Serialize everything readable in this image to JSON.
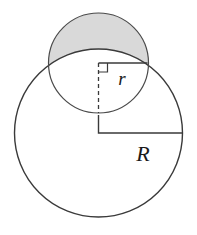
{
  "figure": {
    "background_color": "#ffffff",
    "stroke_color": "#3a3a3a",
    "shaded_fill_color": "#d9d9d9",
    "shaded_region_name": "circular-lens-segment"
  },
  "labels": {
    "small_radius": "r",
    "large_radius": "R"
  },
  "shapes": {
    "large_circle": {
      "name": "large-circle",
      "center_x": 98.5,
      "center_y": 133,
      "radius": 84,
      "stroke_width": 1.4,
      "fill": "none"
    },
    "small_circle": {
      "name": "small-circle",
      "center_x": 98.5,
      "center_y": 63,
      "radius": 50,
      "stroke_width": 1.2,
      "fill": "none"
    },
    "shaded_lens": {
      "name": "shaded-lens",
      "description": "region inside small circle and outside large circle",
      "fill": "#d9d9d9",
      "stroke_width": 1.2
    }
  },
  "annotations": {
    "small_radius_line": {
      "name": "small-radius-segment",
      "x1": 98.5,
      "y1": 63,
      "x2": 147.5,
      "y2": 63,
      "style": "solid"
    },
    "small_vertical_dashed": {
      "name": "small-radius-dashed-segment",
      "x1": 98.5,
      "y1": 63,
      "x2": 98.5,
      "y2": 113,
      "style": "dashed",
      "dash_pattern": "4,3"
    },
    "right_angle_mark": {
      "name": "right-angle-marker",
      "x": 98.5,
      "y": 63,
      "size": 9,
      "direction": "down-right"
    },
    "large_radius_line": {
      "name": "large-radius-segment",
      "x1": 98.5,
      "y1": 133,
      "x2": 182.5,
      "y2": 133,
      "style": "solid"
    },
    "large_corner_riser": {
      "name": "large-radius-corner-riser",
      "x1": 98.5,
      "y1": 133,
      "x2": 98.5,
      "y2": 115,
      "style": "solid"
    },
    "small_radius_label_pos": {
      "x": 122,
      "y": 85
    },
    "large_radius_label_pos": {
      "x": 143,
      "y": 161
    }
  }
}
